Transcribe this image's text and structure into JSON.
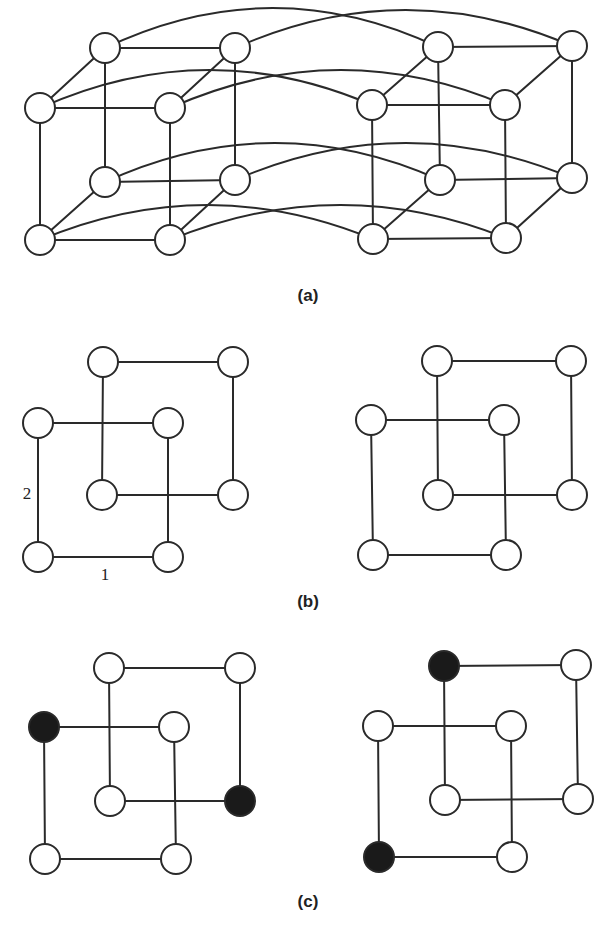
{
  "figure": {
    "panels": [
      {
        "id": "a",
        "caption": "(a)",
        "caption_pos": [
          308,
          301
        ],
        "node_radius": 15,
        "nodes": [
          {
            "x": 105,
            "y": 48,
            "filled": false
          },
          {
            "x": 235,
            "y": 48,
            "filled": false
          },
          {
            "x": 40,
            "y": 108,
            "filled": false
          },
          {
            "x": 170,
            "y": 108,
            "filled": false
          },
          {
            "x": 105,
            "y": 182,
            "filled": false
          },
          {
            "x": 235,
            "y": 180,
            "filled": false
          },
          {
            "x": 40,
            "y": 240,
            "filled": false
          },
          {
            "x": 170,
            "y": 240,
            "filled": false
          },
          {
            "x": 438,
            "y": 47,
            "filled": false
          },
          {
            "x": 572,
            "y": 46,
            "filled": false
          },
          {
            "x": 372,
            "y": 105,
            "filled": false
          },
          {
            "x": 505,
            "y": 105,
            "filled": false
          },
          {
            "x": 440,
            "y": 180,
            "filled": false
          },
          {
            "x": 572,
            "y": 178,
            "filled": false
          },
          {
            "x": 373,
            "y": 239,
            "filled": false
          },
          {
            "x": 506,
            "y": 238,
            "filled": false
          }
        ],
        "edges": [
          [
            0,
            1
          ],
          [
            2,
            3
          ],
          [
            4,
            5
          ],
          [
            6,
            7
          ],
          [
            0,
            4
          ],
          [
            1,
            5
          ],
          [
            2,
            6
          ],
          [
            3,
            7
          ],
          [
            2,
            0
          ],
          [
            3,
            1
          ],
          [
            6,
            4
          ],
          [
            7,
            5
          ],
          [
            8,
            9
          ],
          [
            10,
            11
          ],
          [
            12,
            13
          ],
          [
            14,
            15
          ],
          [
            8,
            12
          ],
          [
            9,
            13
          ],
          [
            10,
            14
          ],
          [
            11,
            15
          ],
          [
            10,
            8
          ],
          [
            11,
            9
          ],
          [
            14,
            12
          ],
          [
            15,
            13
          ]
        ],
        "curved_edges": [
          {
            "from": 0,
            "to": 8,
            "peak_y": 8
          },
          {
            "from": 1,
            "to": 9,
            "peak_y": 10
          },
          {
            "from": 2,
            "to": 10,
            "peak_y": 70
          },
          {
            "from": 3,
            "to": 11,
            "peak_y": 70
          },
          {
            "from": 4,
            "to": 12,
            "peak_y": 143
          },
          {
            "from": 5,
            "to": 13,
            "peak_y": 143
          },
          {
            "from": 6,
            "to": 14,
            "peak_y": 205
          },
          {
            "from": 7,
            "to": 15,
            "peak_y": 205
          }
        ],
        "edge_labels": []
      },
      {
        "id": "b",
        "caption": "(b)",
        "caption_pos": [
          308,
          607
        ],
        "node_radius": 15,
        "cubes": [
          {
            "nodes": [
              {
                "x": 103,
                "y": 362,
                "filled": false
              },
              {
                "x": 233,
                "y": 362,
                "filled": false
              },
              {
                "x": 38,
                "y": 423,
                "filled": false
              },
              {
                "x": 168,
                "y": 423,
                "filled": false
              },
              {
                "x": 102,
                "y": 495,
                "filled": false
              },
              {
                "x": 233,
                "y": 495,
                "filled": false
              },
              {
                "x": 38,
                "y": 557,
                "filled": false
              },
              {
                "x": 168,
                "y": 557,
                "filled": false
              }
            ],
            "edge_labels": [
              {
                "text": "2",
                "x": 27,
                "y": 499
              },
              {
                "text": "1",
                "x": 105,
                "y": 580
              }
            ]
          },
          {
            "nodes": [
              {
                "x": 437,
                "y": 361,
                "filled": false
              },
              {
                "x": 571,
                "y": 361,
                "filled": false
              },
              {
                "x": 371,
                "y": 420,
                "filled": false
              },
              {
                "x": 504,
                "y": 420,
                "filled": false
              },
              {
                "x": 438,
                "y": 495,
                "filled": false
              },
              {
                "x": 572,
                "y": 495,
                "filled": false
              },
              {
                "x": 373,
                "y": 555,
                "filled": false
              },
              {
                "x": 506,
                "y": 555,
                "filled": false
              }
            ],
            "edge_labels": []
          }
        ]
      },
      {
        "id": "c",
        "caption": "(c)",
        "caption_pos": [
          308,
          907
        ],
        "node_radius": 15,
        "cubes": [
          {
            "nodes": [
              {
                "x": 109,
                "y": 668,
                "filled": false
              },
              {
                "x": 240,
                "y": 668,
                "filled": false
              },
              {
                "x": 44,
                "y": 727,
                "filled": true
              },
              {
                "x": 174,
                "y": 727,
                "filled": false
              },
              {
                "x": 110,
                "y": 801,
                "filled": false
              },
              {
                "x": 240,
                "y": 801,
                "filled": true
              },
              {
                "x": 45,
                "y": 859,
                "filled": false
              },
              {
                "x": 176,
                "y": 859,
                "filled": false
              }
            ],
            "edge_labels": []
          },
          {
            "nodes": [
              {
                "x": 444,
                "y": 666,
                "filled": true
              },
              {
                "x": 576,
                "y": 665,
                "filled": false
              },
              {
                "x": 378,
                "y": 726,
                "filled": false
              },
              {
                "x": 511,
                "y": 726,
                "filled": false
              },
              {
                "x": 445,
                "y": 800,
                "filled": false
              },
              {
                "x": 578,
                "y": 799,
                "filled": false
              },
              {
                "x": 379,
                "y": 857,
                "filled": true
              },
              {
                "x": 512,
                "y": 857,
                "filled": false
              }
            ],
            "edge_labels": []
          }
        ]
      }
    ],
    "cube_edges_no_diagonals": [
      [
        0,
        1
      ],
      [
        4,
        5
      ],
      [
        0,
        4
      ],
      [
        1,
        5
      ],
      [
        2,
        3
      ],
      [
        6,
        7
      ],
      [
        2,
        6
      ],
      [
        3,
        7
      ]
    ],
    "colors": {
      "stroke": "#2a2a2a",
      "node_fill": "#ffffff",
      "node_filled": "#1a1a1a",
      "background": "#ffffff"
    }
  }
}
